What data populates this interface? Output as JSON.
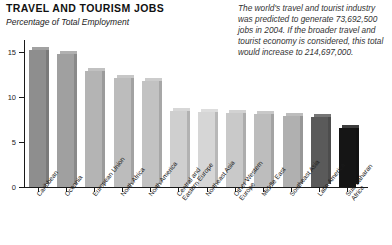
{
  "header": {
    "title": "TRAVEL AND TOURISM JOBS",
    "subtitle": "Percentage of Total Employment"
  },
  "sidenote": {
    "text": "The world's travel and tourist industry was predicted to generate 73,692,500 jobs in 2004. If the broader travel and tourist economy is considered, this total would increase to 214,697,000."
  },
  "chart_data": {
    "type": "bar",
    "title": "TRAVEL AND TOURISM JOBS",
    "subtitle": "Percentage of Total Employment",
    "xlabel": "",
    "ylabel": "Percentage of Total Employment",
    "ylim": [
      0,
      16
    ],
    "yticks": [
      0,
      5,
      10,
      15
    ],
    "ytick_labels": [
      "0",
      "5",
      "10",
      "15"
    ],
    "grid": false,
    "legend": "none",
    "categories": [
      "Caribbean",
      "Oceania",
      "European Union",
      "North Africa",
      "North America",
      "Central and\nEastern Europe",
      "Northeast Asia",
      "Other Western\nEurope",
      "Middle East",
      "Southeast Asia",
      "Latin America",
      "Sub-Saharan\nAfrica"
    ],
    "values": [
      15.2,
      14.8,
      12.9,
      12.1,
      11.8,
      8.4,
      8.3,
      8.2,
      8.1,
      7.9,
      7.8,
      6.6
    ],
    "bar_colors": [
      "#8e8e8e",
      "#a0a0a0",
      "#b4b4b4",
      "#bcbcbc",
      "#c2c2c2",
      "#cfcfcf",
      "#d6d6d6",
      "#c9c9c9",
      "#bdbdbd",
      "#b0b0b0",
      "#5a5a5a",
      "#151515"
    ]
  }
}
